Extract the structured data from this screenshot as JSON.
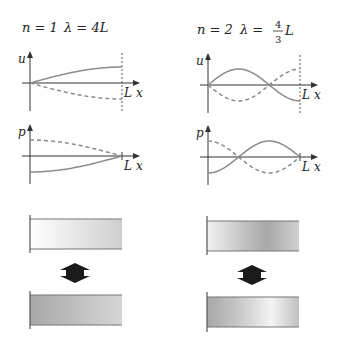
{
  "panels": [
    {
      "mode_label_n": "n = 1",
      "mode_label_lambda": "λ = 4L",
      "n": 1,
      "wavelength_factor": "4",
      "displacement_plot": {
        "ylabel": "u",
        "xlabel": "x",
        "end_label": "L",
        "solid_curve": "sin(πx/2L)",
        "dashed_curve": "-sin(πx/2L)"
      },
      "pressure_plot": {
        "ylabel": "p",
        "xlabel": "x",
        "end_label": "L",
        "solid_curve": "-cos(πx/2L)",
        "dashed_curve": "cos(πx/2L)"
      }
    },
    {
      "mode_label_n": "n = 2",
      "mode_label_lambda_prefix": "λ =",
      "fraction_num": "4",
      "fraction_den": "3",
      "mode_label_lambda_suffix": "L",
      "n": 2,
      "displacement_plot": {
        "ylabel": "u",
        "xlabel": "x",
        "end_label": "L",
        "solid_curve": "sin(3πx/2L)",
        "dashed_curve": "-sin(3πx/2L)"
      },
      "pressure_plot": {
        "ylabel": "p",
        "xlabel": "x",
        "end_label": "L",
        "solid_curve": "-cos(3πx/2L)",
        "dashed_curve": "cos(3πx/2L)"
      }
    }
  ],
  "colors": {
    "curve": "#8a8a8a",
    "axis": "#333333",
    "arrow": "#1a1a1a"
  }
}
